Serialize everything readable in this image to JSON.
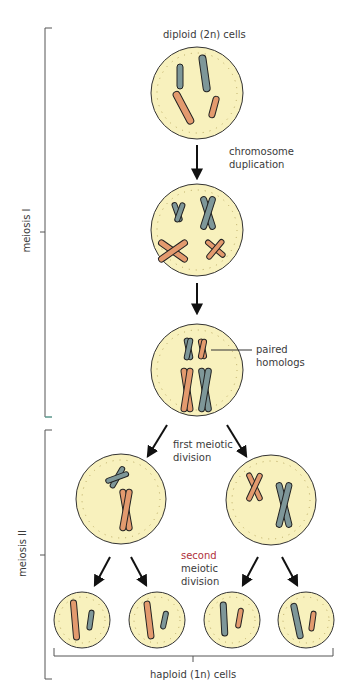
{
  "diagram": {
    "title": "Meiosis",
    "labels": {
      "diploid": "diploid (2n) cells",
      "duplication_1": "chromosome",
      "duplication_2": "duplication",
      "paired_1": "paired",
      "paired_2": "homologs",
      "first_div_1": "first meiotic",
      "first_div_2": "division",
      "second_div_1": "second",
      "second_div_2": "meiotic",
      "second_div_3": "division",
      "haploid": "haploid (1n) cells",
      "meiosis_1": "meiosis I",
      "meiosis_2": "meiosis II"
    },
    "colors": {
      "cell_fill": "#f8f1bd",
      "cell_stroke": "#333333",
      "chrom_blue": "#7e9799",
      "chrom_orange": "#e39a6e",
      "accent_red": "#b0303a",
      "bracket_teal": "#5fb9a8"
    }
  }
}
